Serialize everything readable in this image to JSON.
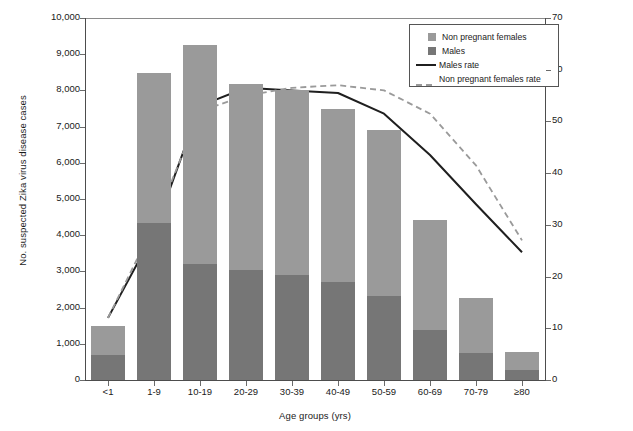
{
  "chart_data": {
    "type": "bar",
    "title": "",
    "subtitle": "",
    "xlabel": "Age groups (yrs)",
    "ylabel": "No. suspected Zika virus disease cases",
    "ylabel_right": "Pregnant of suspected Zika virus disease testing positive (%)",
    "categories": [
      "<1",
      "1-9",
      "10-19",
      "20-29",
      "30-39",
      "40-49",
      "50-59",
      "60-69",
      "70-79",
      "≥80"
    ],
    "ylim": [
      0,
      10000
    ],
    "ylim_right": [
      0,
      70
    ],
    "yticks": [
      "0",
      "1,000",
      "2,000",
      "3,000",
      "4,000",
      "5,000",
      "6,000",
      "7,000",
      "8,000",
      "9,000",
      "10,000"
    ],
    "ytick_values": [
      0,
      1000,
      2000,
      3000,
      4000,
      5000,
      6000,
      7000,
      8000,
      9000,
      10000
    ],
    "yticks_right": [
      "0",
      "10",
      "20",
      "30",
      "40",
      "50",
      "60",
      "70"
    ],
    "ytick_values_right": [
      0,
      10,
      20,
      30,
      40,
      50,
      60,
      70
    ],
    "grid": false,
    "stacked": true,
    "legend_position": "top-right",
    "series": [
      {
        "name": "Males",
        "type": "bar",
        "axis": "left",
        "color": "#767676",
        "values": [
          700,
          4340,
          3200,
          3050,
          2900,
          2720,
          2320,
          1380,
          750,
          280
        ]
      },
      {
        "name": "Non pregnant females",
        "type": "bar",
        "axis": "left",
        "color": "#9a9a9a",
        "values": [
          800,
          4140,
          6050,
          5120,
          5100,
          4780,
          4580,
          3040,
          1520,
          490
        ]
      },
      {
        "name": "Males rate",
        "type": "line",
        "axis": "right",
        "style": "solid",
        "color": "#1f1f1f",
        "values": [
          12.0,
          28.5,
          53.0,
          56.5,
          56.0,
          55.5,
          51.5,
          43.5,
          34.0,
          24.7
        ]
      },
      {
        "name": "Non pregnant females rate",
        "type": "line",
        "axis": "right",
        "style": "dashed",
        "color": "#9a9a9a",
        "values": [
          12.0,
          30.0,
          52.0,
          55.0,
          56.5,
          57.0,
          56.0,
          51.5,
          41.5,
          27.0
        ]
      }
    ],
    "totals": [
      1500,
      8480,
      9250,
      8170,
      8000,
      7500,
      6900,
      4420,
      2270,
      770
    ]
  },
  "legend": {
    "items": [
      {
        "label": "Non pregnant females",
        "marker": "swatch",
        "color": "#9a9a9a"
      },
      {
        "label": "Males",
        "marker": "swatch",
        "color": "#767676"
      },
      {
        "label": "Males rate",
        "marker": "solid-line",
        "color": "#1f1f1f"
      },
      {
        "label": "Non pregnant females rate",
        "marker": "dashed-line",
        "color": "#9a9a9a"
      }
    ]
  }
}
